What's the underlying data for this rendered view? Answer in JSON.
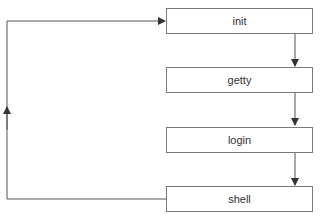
{
  "diagram": {
    "type": "flowchart",
    "nodes": [
      {
        "id": "init",
        "label": "init"
      },
      {
        "id": "getty",
        "label": "getty"
      },
      {
        "id": "login",
        "label": "login"
      },
      {
        "id": "shell",
        "label": "shell"
      }
    ],
    "edges": [
      {
        "from": "init",
        "to": "getty"
      },
      {
        "from": "getty",
        "to": "login"
      },
      {
        "from": "login",
        "to": "shell"
      },
      {
        "from": "shell",
        "to": "init",
        "route": "loop-back-left"
      }
    ]
  }
}
